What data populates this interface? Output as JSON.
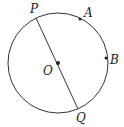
{
  "diagram": {
    "type": "circle-geometry",
    "circle": {
      "cx": 58,
      "cy": 63,
      "r": 50,
      "stroke": "#333333"
    },
    "diameter": {
      "from": "P",
      "to": "Q"
    },
    "points": [
      {
        "id": "P",
        "label": "P",
        "x": 36,
        "y": 18,
        "dot": false,
        "lx": 30,
        "ly": 13
      },
      {
        "id": "A",
        "label": "A",
        "x": 80,
        "y": 19,
        "dot": true,
        "lx": 84,
        "ly": 17
      },
      {
        "id": "B",
        "label": "B",
        "x": 106,
        "y": 58,
        "dot": true,
        "lx": 110,
        "ly": 64
      },
      {
        "id": "O",
        "label": "O",
        "x": 58,
        "y": 63,
        "dot": true,
        "lx": 43,
        "ly": 75
      },
      {
        "id": "Q",
        "label": "Q",
        "x": 78,
        "y": 109,
        "dot": false,
        "lx": 76,
        "ly": 122
      }
    ]
  }
}
